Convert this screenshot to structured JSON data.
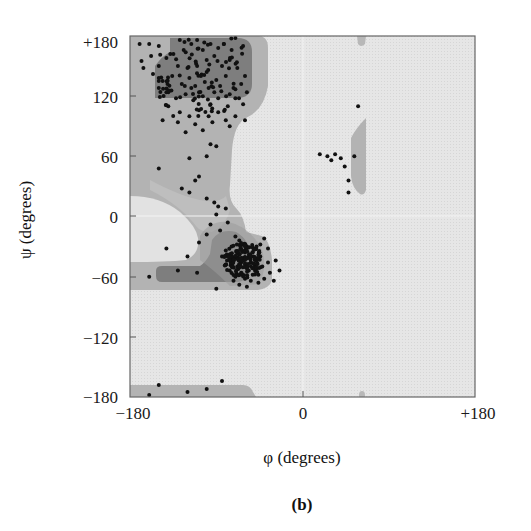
{
  "chart_data": {
    "type": "scatter",
    "title": "",
    "panel_label": "(b)",
    "xlabel": "φ (degrees)",
    "ylabel": "ψ (degrees)",
    "xlim": [
      -180,
      180
    ],
    "ylim": [
      -180,
      180
    ],
    "xticks": [
      "−180",
      "0",
      "+180"
    ],
    "yticks": [
      "+180",
      "120",
      "60",
      "0",
      "−60",
      "−120",
      "−180"
    ],
    "grid": false,
    "background_regions": [
      {
        "name": "disallowed",
        "color": "#e8e8e8"
      },
      {
        "name": "allowed",
        "color": "#b4b4b4"
      },
      {
        "name": "core",
        "color": "#7e7e7e"
      }
    ],
    "clusters": [
      {
        "name": "beta-sheet region",
        "phi_range": [
          -160,
          -60
        ],
        "psi_range": [
          90,
          180
        ]
      },
      {
        "name": "right-handed alpha-helix region",
        "phi_range": [
          -90,
          -30
        ],
        "psi_range": [
          -70,
          -10
        ],
        "center": [
          -63,
          -43
        ]
      },
      {
        "name": "left-handed helix region",
        "phi_range": [
          40,
          70
        ],
        "psi_range": [
          20,
          110
        ]
      }
    ],
    "points": [
      [
        -170,
        172
      ],
      [
        -160,
        172
      ],
      [
        -150,
        170
      ],
      [
        -128,
        176
      ],
      [
        -110,
        176
      ],
      [
        -96,
        172
      ],
      [
        -82,
        172
      ],
      [
        -70,
        178
      ],
      [
        -62,
        170
      ],
      [
        -168,
        155
      ],
      [
        -158,
        160
      ],
      [
        -150,
        150
      ],
      [
        -142,
        158
      ],
      [
        -130,
        150
      ],
      [
        -120,
        148
      ],
      [
        -110,
        150
      ],
      [
        -100,
        156
      ],
      [
        -92,
        160
      ],
      [
        -84,
        150
      ],
      [
        -76,
        156
      ],
      [
        -68,
        148
      ],
      [
        -60,
        140
      ],
      [
        -166,
        148
      ],
      [
        -156,
        142
      ],
      [
        -146,
        135
      ],
      [
        -136,
        140
      ],
      [
        -126,
        132
      ],
      [
        -118,
        138
      ],
      [
        -106,
        140
      ],
      [
        -98,
        128
      ],
      [
        -90,
        136
      ],
      [
        -80,
        140
      ],
      [
        -72,
        128
      ],
      [
        -64,
        132
      ],
      [
        -58,
        124
      ],
      [
        -150,
        128
      ],
      [
        -140,
        124
      ],
      [
        -132,
        118
      ],
      [
        -122,
        122
      ],
      [
        -114,
        116
      ],
      [
        -104,
        120
      ],
      [
        -96,
        112
      ],
      [
        -88,
        118
      ],
      [
        -78,
        110
      ],
      [
        -70,
        118
      ],
      [
        -62,
        112
      ],
      [
        -140,
        110
      ],
      [
        -128,
        104
      ],
      [
        -118,
        100
      ],
      [
        -108,
        106
      ],
      [
        -98,
        100
      ],
      [
        -88,
        104
      ],
      [
        -80,
        96
      ],
      [
        -70,
        100
      ],
      [
        -60,
        96
      ],
      [
        -146,
        96
      ],
      [
        -130,
        94
      ],
      [
        -112,
        92
      ],
      [
        -94,
        94
      ],
      [
        -76,
        90
      ],
      [
        -138,
        162
      ],
      [
        -124,
        166
      ],
      [
        -104,
        166
      ],
      [
        -88,
        168
      ],
      [
        -74,
        166
      ],
      [
        -112,
        130
      ],
      [
        -102,
        134
      ],
      [
        -92,
        124
      ],
      [
        -86,
        130
      ],
      [
        -76,
        122
      ],
      [
        -116,
        128
      ],
      [
        -108,
        124
      ],
      [
        -122,
        84
      ],
      [
        -104,
        86
      ],
      [
        -96,
        72
      ],
      [
        -90,
        70
      ],
      [
        -100,
        60
      ],
      [
        -118,
        58
      ],
      [
        -150,
        48
      ],
      [
        -126,
        28
      ],
      [
        -118,
        24
      ],
      [
        -112,
        36
      ],
      [
        -108,
        40
      ],
      [
        -142,
        -32
      ],
      [
        -100,
        18
      ],
      [
        -92,
        14
      ],
      [
        -88,
        10
      ],
      [
        -90,
        2
      ],
      [
        -80,
        8
      ],
      [
        -78,
        -6
      ],
      [
        -86,
        -14
      ],
      [
        -96,
        -8
      ],
      [
        -100,
        -18
      ],
      [
        -108,
        -26
      ],
      [
        -120,
        -40
      ],
      [
        -130,
        -54
      ],
      [
        -160,
        -60
      ],
      [
        -70,
        -20
      ],
      [
        -66,
        -24
      ],
      [
        -62,
        -28
      ],
      [
        -58,
        -30
      ],
      [
        -60,
        -36
      ],
      [
        -56,
        -40
      ],
      [
        -54,
        -46
      ],
      [
        -58,
        -52
      ],
      [
        -64,
        -56
      ],
      [
        -68,
        -50
      ],
      [
        -72,
        -44
      ],
      [
        -76,
        -38
      ],
      [
        -74,
        -30
      ],
      [
        -80,
        -34
      ],
      [
        -84,
        -40
      ],
      [
        -70,
        -60
      ],
      [
        -60,
        -62
      ],
      [
        -66,
        -38
      ],
      [
        -62,
        -42
      ],
      [
        -64,
        -46
      ],
      [
        -60,
        -48
      ],
      [
        -56,
        -54
      ],
      [
        -52,
        -58
      ],
      [
        -50,
        -50
      ],
      [
        -48,
        -44
      ],
      [
        -52,
        -36
      ],
      [
        -48,
        -30
      ],
      [
        -44,
        -40
      ],
      [
        -42,
        -50
      ],
      [
        -46,
        -58
      ],
      [
        -40,
        -62
      ],
      [
        -36,
        -46
      ],
      [
        -34,
        -56
      ],
      [
        -28,
        -44
      ],
      [
        -24,
        -54
      ],
      [
        -30,
        -64
      ],
      [
        -46,
        -66
      ],
      [
        -90,
        -72
      ],
      [
        -110,
        -56
      ],
      [
        -80,
        -48
      ],
      [
        -76,
        -54
      ],
      [
        -72,
        -64
      ],
      [
        -66,
        -68
      ],
      [
        -58,
        -70
      ],
      [
        -54,
        -64
      ],
      [
        -44,
        -28
      ],
      [
        -40,
        -22
      ],
      [
        -36,
        -32
      ],
      [
        18,
        62
      ],
      [
        26,
        60
      ],
      [
        30,
        56
      ],
      [
        34,
        62
      ],
      [
        40,
        58
      ],
      [
        44,
        50
      ],
      [
        48,
        24
      ],
      [
        48,
        36
      ],
      [
        54,
        60
      ],
      [
        58,
        110
      ],
      [
        -160,
        -178
      ],
      [
        -150,
        -168
      ],
      [
        -120,
        -175
      ],
      [
        -100,
        -172
      ],
      [
        -84,
        -164
      ]
    ]
  }
}
